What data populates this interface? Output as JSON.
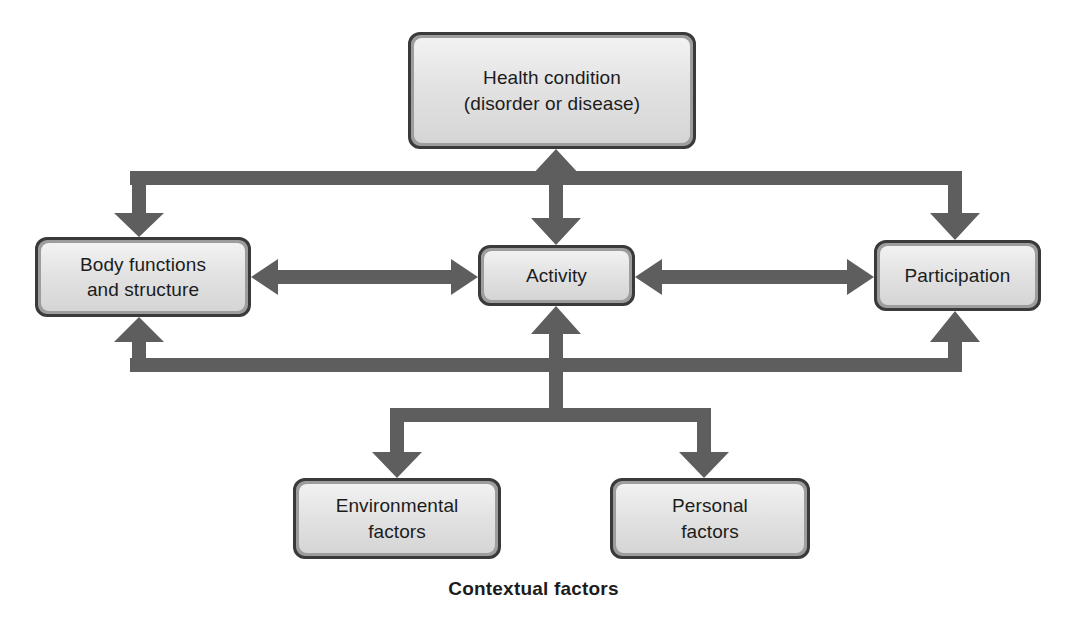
{
  "diagram": {
    "caption": "Contextual factors",
    "colors": {
      "arrow": "#5e5e5e",
      "arrow_edge": "#4a4a4a",
      "box_border": "#3a3a3a",
      "box_bevel": "#9d9d9d",
      "box_fill_top": "#f2f2f2",
      "box_fill_bottom": "#d5d5d5",
      "text": "#1c1c1c",
      "background": "#ffffff"
    },
    "nodes": [
      {
        "id": "health",
        "label": "Health condition\n(disorder or disease)",
        "line1": "Health condition",
        "line2": "(disorder or disease)"
      },
      {
        "id": "body",
        "label": "Body functions\nand structure",
        "line1": "Body functions",
        "line2": "and structure"
      },
      {
        "id": "activity",
        "label": "Activity",
        "line1": "Activity",
        "line2": ""
      },
      {
        "id": "participation",
        "label": "Participation",
        "line1": "Participation",
        "line2": ""
      },
      {
        "id": "environmental",
        "label": "Environmental\nfactors",
        "line1": "Environmental",
        "line2": "factors"
      },
      {
        "id": "personal",
        "label": "Personal\nfactors",
        "line1": "Personal",
        "line2": "factors"
      }
    ],
    "connectors": [
      {
        "id": "health-activity",
        "from": "health",
        "to": "activity",
        "style": "double-headed-vertical"
      },
      {
        "id": "body-activity",
        "from": "body",
        "to": "activity",
        "style": "double-headed-horizontal"
      },
      {
        "id": "activity-participation",
        "from": "activity",
        "to": "participation",
        "style": "double-headed-horizontal"
      },
      {
        "id": "health-body-bracket",
        "from": "health",
        "to": "body",
        "style": "bracket-down-left"
      },
      {
        "id": "health-participation-bracket",
        "from": "health",
        "to": "participation",
        "style": "bracket-down-right"
      },
      {
        "id": "body-contextual-bracket",
        "from": "contextual",
        "to": "body",
        "style": "bracket-up-left"
      },
      {
        "id": "participation-contextual-bracket",
        "from": "contextual",
        "to": "participation",
        "style": "bracket-up-right"
      },
      {
        "id": "activity-contextual",
        "from": "contextual",
        "to": "activity",
        "style": "fork-up"
      },
      {
        "id": "contextual-environmental",
        "from": "activity",
        "to": "environmental",
        "style": "fork-down-left"
      },
      {
        "id": "contextual-personal",
        "from": "activity",
        "to": "personal",
        "style": "fork-down-right"
      }
    ]
  }
}
